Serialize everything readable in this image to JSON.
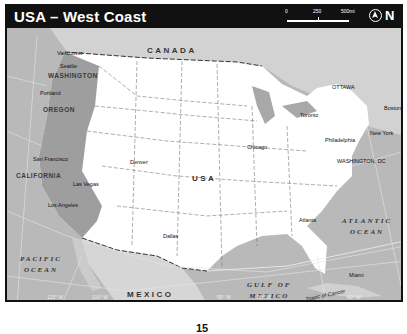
{
  "header": {
    "title": "USA – West Coast",
    "scale": {
      "labels": [
        "0",
        "250",
        "500mi"
      ]
    },
    "north_label": "N"
  },
  "countries": [
    "CANADA",
    "USA",
    "MEXICO"
  ],
  "states": [
    "WASHINGTON",
    "OREGON",
    "CALIFORNIA"
  ],
  "oceans": {
    "pacific": [
      "PACIFIC",
      "OCEAN"
    ],
    "atlantic": [
      "ATLANTIC",
      "OCEAN"
    ],
    "gulf": [
      "GULF OF",
      "MEXICO"
    ]
  },
  "cities": [
    {
      "name": "Vancouver",
      "type": "city"
    },
    {
      "name": "Seattle",
      "type": "city"
    },
    {
      "name": "Portland",
      "type": "city"
    },
    {
      "name": "San Francisco",
      "type": "city"
    },
    {
      "name": "Las Vegas",
      "type": "city"
    },
    {
      "name": "Los Angeles",
      "type": "city"
    },
    {
      "name": "Denver",
      "type": "state-capital"
    },
    {
      "name": "Dallas",
      "type": "major-city"
    },
    {
      "name": "Chicago",
      "type": "major-city"
    },
    {
      "name": "Atlanta",
      "type": "state-capital"
    },
    {
      "name": "Miami",
      "type": "city"
    },
    {
      "name": "Toronto",
      "type": "city"
    },
    {
      "name": "OTTAWA",
      "type": "national-capital"
    },
    {
      "name": "Boston",
      "type": "state-capital"
    },
    {
      "name": "New York",
      "type": "city"
    },
    {
      "name": "Philadelphia",
      "type": "city"
    },
    {
      "name": "WASHINGTON, DC",
      "type": "national-capital"
    }
  ],
  "annotations": {
    "tropic": "Tropic of Cancer",
    "longitudes": [
      "115° W",
      "110° W",
      "95° W",
      "90° W",
      "80° W"
    ]
  },
  "page_number": "15"
}
